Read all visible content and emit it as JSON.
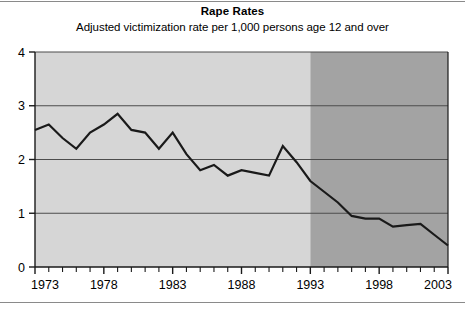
{
  "chart_data": {
    "type": "line",
    "title": "Rape Rates",
    "subtitle": "Adjusted victimization rate per 1,000 persons age 12 and over",
    "xlabel": "",
    "ylabel": "",
    "xlim": [
      1973,
      2003
    ],
    "ylim": [
      0,
      4
    ],
    "ytick_labels": [
      "0",
      "1",
      "2",
      "3",
      "4"
    ],
    "ytick_values": [
      0,
      1,
      2,
      3,
      4
    ],
    "xtick_labels": [
      "1973",
      "1978",
      "1983",
      "1988",
      "1993",
      "1998",
      "2003"
    ],
    "xtick_values": [
      1973,
      1978,
      1983,
      1988,
      1993,
      1998,
      2003
    ],
    "minor_xticks_every": 1,
    "grid": "horizontal",
    "legend": "none",
    "x": [
      1973,
      1974,
      1975,
      1976,
      1977,
      1978,
      1979,
      1980,
      1981,
      1982,
      1983,
      1984,
      1985,
      1986,
      1987,
      1988,
      1989,
      1990,
      1991,
      1992,
      1993,
      1994,
      1995,
      1996,
      1997,
      1998,
      1999,
      2000,
      2001,
      2002,
      2003
    ],
    "values": [
      2.55,
      2.65,
      2.4,
      2.2,
      2.5,
      2.65,
      2.85,
      2.55,
      2.5,
      2.2,
      2.5,
      2.1,
      1.8,
      1.9,
      1.7,
      1.8,
      1.75,
      1.7,
      2.25,
      1.95,
      1.6,
      1.4,
      1.2,
      0.95,
      0.9,
      0.9,
      0.75,
      0.78,
      0.8,
      0.6,
      0.4
    ],
    "series_color": "#1a1a1a",
    "series_width": 2.2,
    "shading": [
      {
        "name": "early-period",
        "from": 1973,
        "to": 1993,
        "color": "#d6d6d6"
      },
      {
        "name": "late-period",
        "from": 1993,
        "to": 2003,
        "color": "#a3a3a3"
      }
    ],
    "gridline_color": "#4d4d4d",
    "axis_color": "#1a1a1a"
  }
}
